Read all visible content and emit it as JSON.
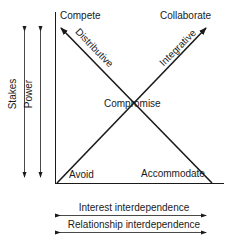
{
  "diagram": {
    "corners": {
      "top_left": "Compete",
      "top_right": "Collaborate",
      "bottom_left": "Avoid",
      "bottom_right": "Accommodate",
      "center": "Compromise"
    },
    "diagonals": {
      "left_arrow": "Distributive",
      "right_arrow": "Integrative"
    },
    "vertical_axes": [
      "Stakes",
      "Power"
    ],
    "horizontal_axes": [
      "Interest interdependence",
      "Relationship interdependence"
    ]
  }
}
